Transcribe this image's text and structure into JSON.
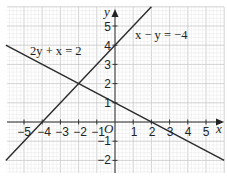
{
  "chart_data": {
    "type": "line",
    "title": "",
    "xlabel": "x",
    "ylabel": "y",
    "origin_label": "O",
    "xlim": [
      -6,
      6
    ],
    "ylim": [
      -2.7,
      6
    ],
    "x_ticks": [
      -5,
      -4,
      -3,
      -2,
      -1,
      1,
      2,
      3,
      4,
      5
    ],
    "y_ticks": [
      -2,
      -1,
      1,
      2,
      3,
      4,
      5
    ],
    "grid": true,
    "minor_grid_per_unit": 5,
    "series": [
      {
        "name": "2y + x = 2",
        "label_text": "2y + x = 2",
        "equation": "y = 1 - x/2",
        "points": [
          [
            -6,
            4
          ],
          [
            -4,
            3
          ],
          [
            -2,
            2
          ],
          [
            0,
            1
          ],
          [
            2,
            0
          ],
          [
            4,
            -1
          ],
          [
            6,
            -2
          ]
        ]
      },
      {
        "name": "x − y = −4",
        "label_text": "x − y = −4",
        "equation": "y = x + 4",
        "points": [
          [
            -6,
            -2
          ],
          [
            -4,
            0
          ],
          [
            -2,
            2
          ],
          [
            0,
            4
          ],
          [
            2,
            6
          ]
        ]
      }
    ],
    "intersection": [
      -2,
      2
    ]
  },
  "labels": {
    "x_axis": "x",
    "y_axis": "y",
    "origin": "O",
    "line1": "2y + x = 2",
    "line2": "x − y = −4",
    "xt": {
      "m5": "−5",
      "m4": "−4",
      "m3": "−3",
      "m2": "−2",
      "m1": "−1",
      "p1": "1",
      "p2": "2",
      "p3": "3",
      "p4": "4",
      "p5": "5"
    },
    "yt": {
      "m2": "−2",
      "m1": "−1",
      "p1": "1",
      "p2": "2",
      "p3": "3",
      "p4": "4",
      "p5": "5"
    }
  }
}
